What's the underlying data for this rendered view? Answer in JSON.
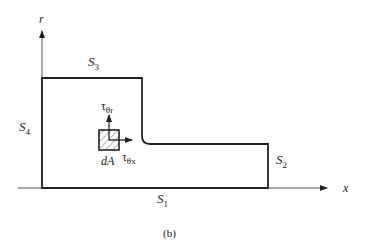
{
  "figure": {
    "caption": "(b)",
    "axes": {
      "vertical_label": "r",
      "horizontal_label": "x"
    },
    "surfaces": {
      "s1": {
        "base": "S",
        "sub": "1"
      },
      "s2": {
        "base": "S",
        "sub": "2"
      },
      "s3": {
        "base": "S",
        "sub": "3"
      },
      "s4": {
        "base": "S",
        "sub": "4"
      }
    },
    "element": {
      "label": "dA",
      "stress_up": {
        "base": "τ",
        "sub": "θr"
      },
      "stress_right": {
        "base": "τ",
        "sub": "θx"
      }
    },
    "colors": {
      "line": "#222222",
      "axis": "#555555"
    }
  }
}
